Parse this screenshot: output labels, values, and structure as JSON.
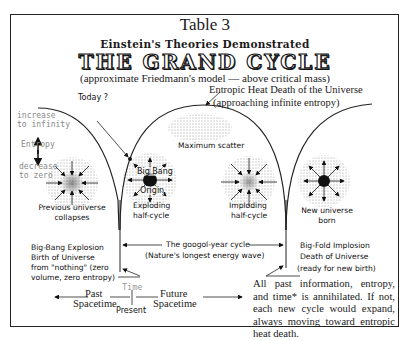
{
  "header": {
    "table_number": "Table 3",
    "subtitle": "Einstein's Theories Demonstrated",
    "title": "THE GRAND CYCLE",
    "model_note": "(approximate Friedmann's model — above critical mass)"
  },
  "annotations": {
    "heat_death_line1": "Entropic Heat Death of the Universe",
    "heat_death_line2": "(approaching infinite entropy)",
    "today": "Today ?",
    "maximum_scatter": "Maximum scatter"
  },
  "entropy_scale": {
    "increase_line1": "increase",
    "increase_line2": "to infinity",
    "label": "Entropy",
    "decrease_line1": "decrease",
    "decrease_line2": "to zero"
  },
  "stages": {
    "previous_collapse_line1": "Previous universe",
    "previous_collapse_line2": "collapses",
    "origin_line1": "Big Bang",
    "origin_line2": "Origin",
    "exploding_line1": "Exploding",
    "exploding_line2": "half-cycle",
    "imploding_line1": "Imploding",
    "imploding_line2": "half-cycle",
    "new_universe_line1": "New universe",
    "new_universe_line2": "born"
  },
  "cycle": {
    "line1": "The googol-year cycle",
    "line2": "(Nature's longest energy wave)"
  },
  "big_bang": {
    "line1": "Big-Bang Explosion",
    "line2": "Birth of Universe",
    "line3": "from \"nothing\" (zero",
    "line4": "volume, zero entropy)"
  },
  "big_fold": {
    "line1": "Big-Fold Implosion",
    "line2": "Death of Universe",
    "line3": "(ready for new birth)"
  },
  "timeline": {
    "time_label": "Time",
    "past_line1": "Past",
    "past_line2": "Spacetime",
    "present": "Present",
    "future_line1": "Future",
    "future_line2": "Spacetime"
  },
  "footnote": "All past information, entropy, and time* is annihilated.  If not, each new cycle would expand, always moving toward entropic heat death."
}
